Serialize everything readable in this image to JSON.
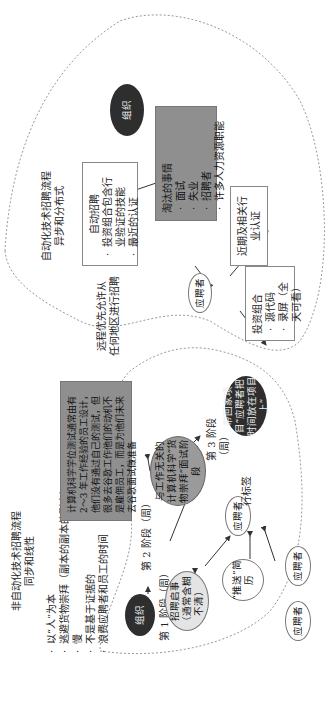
{
  "top_section": {
    "title_line1": "自动化技术招聘流程",
    "title_line2": "异步和分布式",
    "org_label": "组织",
    "auto_box": {
      "heading": "自动招聘",
      "bullets": [
        "投资组合包含行业验证的技能",
        "最近的认证"
      ]
    },
    "eliminated_box": {
      "heading": "淘汰的事情",
      "bullets": [
        "面试",
        "失业",
        "招聘者",
        "许多人力资源职能"
      ]
    },
    "candidate_label": "应聘者",
    "cert_box": "近期及相关行业认证",
    "portfolio_box": {
      "heading": "投资组合",
      "bullets": [
        "源代码",
        "录屏（全天可看）"
      ]
    },
    "remote_note_line1": "远程优先允许从",
    "remote_note_line2": "任何地区进行招聘"
  },
  "bottom_section": {
    "title_line1": "非自动化技术招聘流程",
    "title_line2": "同步和线性",
    "bullets": [
      "以“人”为本",
      "逃避货物崇拜（副本的副本的副本）",
      "慢",
      "不是基于证据的",
      "浪费应聘者和员工的时间"
    ],
    "org_label": "组织",
    "stage1_label": "第 1 阶段（周）",
    "job_posting": "招聘启事（通常含糊不清）",
    "stage2_label": "第 2 阶段（周）",
    "resume_push": "“推送”简历",
    "candidates": [
      "应聘者",
      "应聘者",
      "应聘者"
    ],
    "buzzword_label": "行标签",
    "cs_exam": "与工作无关的计算机科学“货物崇拜”面试阶段",
    "stage3_label": "第 3 阶段（周）",
    "takehome": "带回家项目“应聘者把时间放在项目上”",
    "gray_box": "计算机科学学位测试通常由有 2～3 年工作经验的员工设计，他们没有通过自己的测试，但很多去谷歌工作他们的动机不是雇佣员工，而是为他们未来去谷歌面试做准备"
  },
  "colors": {
    "dark_node": "#2e2e2e",
    "gray_box": "#8f8f8f",
    "mid_node": "#9a9a9a",
    "light_node": "#e4e4e4",
    "dotted_outline": "#999999"
  }
}
